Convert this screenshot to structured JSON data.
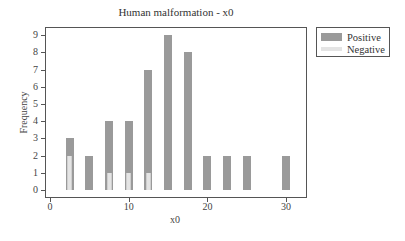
{
  "chart_data": {
    "type": "bar",
    "stacked": false,
    "overlay": true,
    "title": "Human malformation - x0",
    "xlabel": "x0",
    "ylabel": "Frequency",
    "x": [
      2.5,
      5,
      7.5,
      10,
      12.5,
      15,
      17.5,
      20,
      22.5,
      25,
      30
    ],
    "series": [
      {
        "name": "Positive",
        "color": "#9a9a9a",
        "values": [
          3,
          2,
          4,
          4,
          7,
          9,
          8,
          2,
          2,
          2,
          2
        ]
      },
      {
        "name": "Negative",
        "color": "#e4e4e4",
        "values": [
          2,
          0,
          1,
          1,
          1,
          0,
          0,
          0,
          0,
          0,
          0
        ]
      }
    ],
    "xlim": [
      -0.6,
      32.7
    ],
    "ylim": [
      -0.45,
      9.5
    ],
    "xticks": [
      0,
      10,
      20,
      30
    ],
    "yticks": [
      0,
      1,
      2,
      3,
      4,
      5,
      6,
      7,
      8,
      9
    ],
    "grid": false,
    "legend_position": "outside-right-top"
  },
  "title": "Human malformation - x0",
  "xaxis": {
    "label": "x0",
    "ticks": [
      "0",
      "10",
      "20",
      "30"
    ]
  },
  "yaxis": {
    "label": "Frequency",
    "ticks": [
      "0",
      "1",
      "2",
      "3",
      "4",
      "5",
      "6",
      "7",
      "8",
      "9"
    ]
  },
  "legend": {
    "items": [
      {
        "label": "Positive",
        "color": "#9a9a9a"
      },
      {
        "label": "Negative",
        "color": "#e4e4e4"
      }
    ]
  }
}
